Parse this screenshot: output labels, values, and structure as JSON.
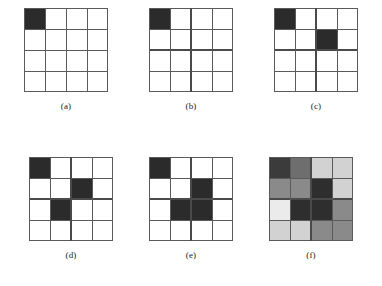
{
  "figure": {
    "grid_size": 4,
    "colors": {
      "dark": "#2b2b2b",
      "empty": "#ffffff",
      "line": "#5a5a5a",
      "bold_line": "#4a4a4a",
      "background": "#ffffff",
      "text": "#1a1a1a"
    },
    "shades": {
      "very_dark": "#2e2e2e",
      "dark": "#3b3b3b",
      "medium_dark": "#6e6e6e",
      "medium": "#8a8a8a",
      "light": "#d2d2d2",
      "very_light": "#ebebeb"
    }
  },
  "panels": [
    {
      "id": "a",
      "caption": "(a)",
      "bold_vertical": null,
      "bold_horizontal": null,
      "cells": [
        [
          "#2b2b2b",
          "#ffffff",
          "#ffffff",
          "#ffffff"
        ],
        [
          "#ffffff",
          "#ffffff",
          "#ffffff",
          "#ffffff"
        ],
        [
          "#ffffff",
          "#ffffff",
          "#ffffff",
          "#ffffff"
        ],
        [
          "#ffffff",
          "#ffffff",
          "#ffffff",
          "#ffffff"
        ]
      ]
    },
    {
      "id": "b",
      "caption": "(b)",
      "bold_vertical": 2,
      "bold_horizontal": 2,
      "cells": [
        [
          "#2b2b2b",
          "#ffffff",
          "#ffffff",
          "#ffffff"
        ],
        [
          "#ffffff",
          "#ffffff",
          "#ffffff",
          "#ffffff"
        ],
        [
          "#ffffff",
          "#ffffff",
          "#ffffff",
          "#ffffff"
        ],
        [
          "#ffffff",
          "#ffffff",
          "#ffffff",
          "#ffffff"
        ]
      ]
    },
    {
      "id": "c",
      "caption": "(c)",
      "bold_vertical": 2,
      "bold_horizontal": 2,
      "cells": [
        [
          "#2b2b2b",
          "#ffffff",
          "#ffffff",
          "#ffffff"
        ],
        [
          "#ffffff",
          "#ffffff",
          "#2b2b2b",
          "#ffffff"
        ],
        [
          "#ffffff",
          "#ffffff",
          "#ffffff",
          "#ffffff"
        ],
        [
          "#ffffff",
          "#ffffff",
          "#ffffff",
          "#ffffff"
        ]
      ]
    },
    {
      "id": "d",
      "caption": "(d)",
      "bold_vertical": 2,
      "bold_horizontal": 2,
      "cells": [
        [
          "#2b2b2b",
          "#ffffff",
          "#ffffff",
          "#ffffff"
        ],
        [
          "#ffffff",
          "#ffffff",
          "#2b2b2b",
          "#ffffff"
        ],
        [
          "#ffffff",
          "#2b2b2b",
          "#ffffff",
          "#ffffff"
        ],
        [
          "#ffffff",
          "#ffffff",
          "#ffffff",
          "#ffffff"
        ]
      ]
    },
    {
      "id": "e",
      "caption": "(e)",
      "bold_vertical": 2,
      "bold_horizontal": 2,
      "cells": [
        [
          "#2b2b2b",
          "#ffffff",
          "#ffffff",
          "#ffffff"
        ],
        [
          "#ffffff",
          "#ffffff",
          "#2b2b2b",
          "#ffffff"
        ],
        [
          "#ffffff",
          "#2b2b2b",
          "#2b2b2b",
          "#ffffff"
        ],
        [
          "#ffffff",
          "#ffffff",
          "#ffffff",
          "#ffffff"
        ]
      ]
    },
    {
      "id": "f",
      "caption": "(f)",
      "bold_vertical": 2,
      "bold_horizontal": 2,
      "cells": [
        [
          "#3b3b3b",
          "#6e6e6e",
          "#d2d2d2",
          "#d2d2d2"
        ],
        [
          "#8a8a8a",
          "#8a8a8a",
          "#2e2e2e",
          "#d2d2d2"
        ],
        [
          "#ebebeb",
          "#2e2e2e",
          "#2e2e2e",
          "#8a8a8a"
        ],
        [
          "#d2d2d2",
          "#d2d2d2",
          "#8a8a8a",
          "#8a8a8a"
        ]
      ]
    }
  ]
}
